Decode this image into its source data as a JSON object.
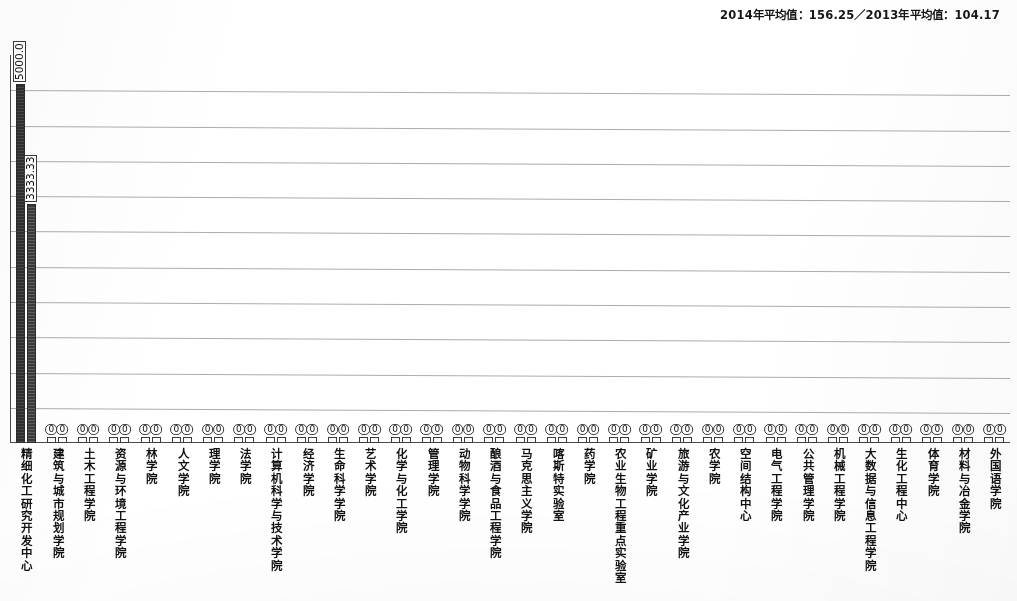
{
  "header": {
    "note": "2014年平均值：156.25／2013年平均值：104.17"
  },
  "chart_data": {
    "type": "bar",
    "title": "",
    "subtitle": "",
    "xlabel": "",
    "ylabel": "",
    "grid": true,
    "gridline_count": 10,
    "legend_position": "none",
    "ylim": [
      0,
      5400
    ],
    "categories": [
      "精细化工研究开发中心",
      "建筑与城市规划学院",
      "土木工程学院",
      "资源与环境工程学院",
      "林学院",
      "人文学院",
      "理学院",
      "法学院",
      "计算机科学与技术学院",
      "经济学院",
      "生命科学学院",
      "艺术学院",
      "化学与化工学院",
      "管理学院",
      "动物科学学院",
      "酿酒与食品工程学院",
      "马克思主义学院",
      "喀斯特实验室",
      "药学院",
      "农业生物工程重点实验室",
      "矿业学院",
      "旅游与文化产业学院",
      "农学院",
      "空间结构中心",
      "电气工程学院",
      "公共管理学院",
      "机械工程学院",
      "大数据与信息工程学院",
      "生化工程中心",
      "体育学院",
      "材料与冶金学院",
      "外国语学院"
    ],
    "series": [
      {
        "name": "2014",
        "values": [
          5000.0,
          0,
          0,
          0,
          0,
          0,
          0,
          0,
          0,
          0,
          0,
          0,
          0,
          0,
          0,
          0,
          0,
          0,
          0,
          0,
          0,
          0,
          0,
          0,
          0,
          0,
          0,
          0,
          0,
          0,
          0,
          0
        ],
        "labels": [
          "5000.0",
          "0",
          "0",
          "0",
          "0",
          "0",
          "0",
          "0",
          "0",
          "0",
          "0",
          "0",
          "0",
          "0",
          "0",
          "0",
          "0",
          "0",
          "0",
          "0",
          "0",
          "0",
          "0",
          "0",
          "0",
          "0",
          "0",
          "0",
          "0",
          "0",
          "0",
          "0"
        ]
      },
      {
        "name": "2013",
        "values": [
          3333.33,
          0,
          0,
          0,
          0,
          0,
          0,
          0,
          0,
          0,
          0,
          0,
          0,
          0,
          0,
          0,
          0,
          0,
          0,
          0,
          0,
          0,
          0,
          0,
          0,
          0,
          0,
          0,
          0,
          0,
          0,
          0
        ],
        "labels": [
          "3333.33",
          "0",
          "0",
          "0",
          "0",
          "0",
          "0",
          "0",
          "0",
          "0",
          "0",
          "0",
          "0",
          "0",
          "0",
          "0",
          "0",
          "0",
          "0",
          "0",
          "0",
          "0",
          "0",
          "0",
          "0",
          "0",
          "0",
          "0",
          "0",
          "0",
          "0",
          "0"
        ]
      }
    ],
    "colors": {
      "series1": "#2e2e2e",
      "series2": "#3a3a3a",
      "gridline": "#adadad",
      "axis": "#4a4a4a",
      "background": "#ffffff"
    }
  }
}
